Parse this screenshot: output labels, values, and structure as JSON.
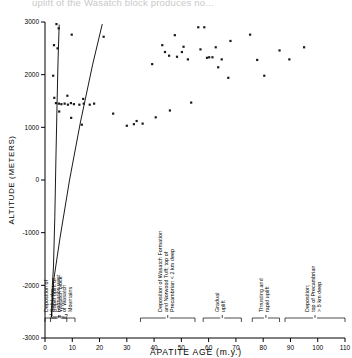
{
  "top_clipped_text": "uplift of the Wasatch block produces no...",
  "chart_data": {
    "type": "scatter",
    "title": "",
    "xlabel": "APATITE  AGE  (m.y.)",
    "ylabel": "ALTITUDE  (METERS)",
    "xlim": [
      0,
      110
    ],
    "ylim": [
      -3000,
      3000
    ],
    "xticks": [
      0,
      10,
      20,
      30,
      40,
      50,
      60,
      70,
      80,
      90,
      100,
      110
    ],
    "yticks": [
      3000,
      2000,
      1000,
      0,
      -1000,
      -2000,
      -3000
    ],
    "xtick_labels": [
      "0",
      "10",
      "20",
      "30",
      "40",
      "50",
      "60",
      "70",
      "80",
      "90",
      "100",
      "110"
    ],
    "ytick_labels": [
      "3000",
      "2000",
      "1000",
      "0",
      "-1000",
      "-2000",
      "-3000"
    ],
    "grid": false,
    "legend": "none",
    "points": [
      [
        4.2,
        2960
      ],
      [
        5.0,
        2880
      ],
      [
        3.3,
        2560
      ],
      [
        4.6,
        2500
      ],
      [
        9.8,
        2760
      ],
      [
        3.0,
        1980
      ],
      [
        3.4,
        1560
      ],
      [
        8.2,
        1600
      ],
      [
        5.2,
        1300
      ],
      [
        9.6,
        1180
      ],
      [
        14.0,
        1540
      ],
      [
        13.5,
        1050
      ],
      [
        4.0,
        1460
      ],
      [
        5.1,
        1450
      ],
      [
        6.0,
        1440
      ],
      [
        7.2,
        1450
      ],
      [
        8.4,
        1430
      ],
      [
        9.5,
        1460
      ],
      [
        10.6,
        1440
      ],
      [
        12.6,
        1430
      ],
      [
        14.2,
        1450
      ],
      [
        16.4,
        1430
      ],
      [
        18.0,
        1450
      ],
      [
        21.5,
        2720
      ],
      [
        25.0,
        1260
      ],
      [
        30.0,
        1030
      ],
      [
        32.6,
        1060
      ],
      [
        33.6,
        1120
      ],
      [
        35.8,
        1070
      ],
      [
        39.3,
        2200
      ],
      [
        40.6,
        1190
      ],
      [
        43.0,
        2560
      ],
      [
        44.0,
        2430
      ],
      [
        45.5,
        2360
      ],
      [
        45.8,
        1320
      ],
      [
        47.6,
        2750
      ],
      [
        48.4,
        2340
      ],
      [
        50.2,
        2430
      ],
      [
        50.8,
        2530
      ],
      [
        52.4,
        2290
      ],
      [
        53.6,
        1470
      ],
      [
        56.2,
        2900
      ],
      [
        58.4,
        2900
      ],
      [
        57.0,
        2480
      ],
      [
        59.4,
        2320
      ],
      [
        60.2,
        2330
      ],
      [
        61.4,
        2330
      ],
      [
        62.6,
        2520
      ],
      [
        63.5,
        2140
      ],
      [
        64.8,
        2290
      ],
      [
        68.0,
        2640
      ],
      [
        67.2,
        1940
      ],
      [
        75.2,
        2760
      ],
      [
        77.8,
        2280
      ],
      [
        80.4,
        1980
      ],
      [
        86.0,
        2460
      ],
      [
        89.6,
        2290
      ],
      [
        95.0,
        2520
      ]
    ],
    "curve_label": "uplift-history-curve",
    "curve": [
      [
        2.4,
        -2600
      ],
      [
        2.7,
        -2000
      ],
      [
        3.1,
        -1650
      ],
      [
        3.6,
        -700
      ],
      [
        4.0,
        400
      ],
      [
        4.4,
        1400
      ],
      [
        4.8,
        2300
      ],
      [
        5.2,
        2950
      ]
    ],
    "curve_lower": [
      [
        2.4,
        -2600
      ],
      [
        3.2,
        -1900
      ],
      [
        5.5,
        -1100
      ],
      [
        9.0,
        0
      ],
      [
        13.0,
        1100
      ],
      [
        17.5,
        2200
      ],
      [
        21.0,
        2960
      ]
    ]
  },
  "annotations": [
    {
      "name": "rapid-uplift",
      "text_lines": [
        "Rapid  uplift  of",
        "Wasatch  block"
      ],
      "x_start": 2,
      "x_end": 8
    },
    {
      "name": "salt-lake-deposition",
      "text_lines": [
        "Deposition  of",
        "Salt  Lake",
        "Formation  west",
        "of  Wasatch",
        "Mountains"
      ],
      "x_start": 0,
      "x_end": 11
    },
    {
      "name": "wasatch-formation-deposition",
      "text_lines": [
        "Deposition  of  Wasatch  Formation",
        "and  Norwood  Tuff;  top  of",
        "Precambrian  < 2  km  deep"
      ],
      "x_start": 35,
      "x_end": 55
    },
    {
      "name": "gradual-uplift",
      "text_lines": [
        "Gradual",
        "uplift"
      ],
      "x_start": 58,
      "x_end": 72
    },
    {
      "name": "thrusting-rapid-uplift",
      "text_lines": [
        "Thrusting  and",
        "rapid  uplift"
      ],
      "x_start": 76,
      "x_end": 86
    },
    {
      "name": "precambrian-deposition",
      "text_lines": [
        "Deposition;",
        "top  of  Precambrian",
        "> 5  km  deep"
      ],
      "x_start": 88,
      "x_end": 110
    }
  ],
  "bracket_question_marks": "?——?",
  "colors": {
    "ink": "#000000",
    "point": "#1a1a1a",
    "background": "#ffffff"
  }
}
